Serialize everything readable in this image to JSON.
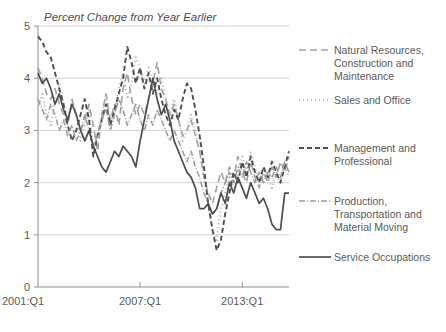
{
  "chart_data": {
    "type": "line",
    "title": "Percent Change from Year Earlier",
    "xlabel": "",
    "ylabel": "",
    "ylim": [
      0,
      5
    ],
    "yticks": [
      0,
      1,
      2,
      3,
      4,
      5
    ],
    "ytick_labels": [
      "0",
      "1",
      "2",
      "3",
      "4",
      "5"
    ],
    "grid": true,
    "grid_axis": "y",
    "legend_position": "right",
    "x_start_label": "2001:Q1",
    "xticks": [
      0,
      24,
      48
    ],
    "xtick_labels": [
      "2001:Q1",
      "2007:Q1",
      "2013:Q1"
    ],
    "x_count": 60,
    "series": [
      {
        "name": "Natural Resources, Construction and Maintenance",
        "legend_label_lines": [
          "Natural Resources,",
          "Construction and",
          "Maintenance"
        ],
        "style": "dashed",
        "color": "#a0a0a0",
        "width": 1.6,
        "dasharray": "7,4",
        "values": [
          4.2,
          4.0,
          3.7,
          3.6,
          3.8,
          3.5,
          3.3,
          3.1,
          3.6,
          3.3,
          3.0,
          3.2,
          3.5,
          3.1,
          2.6,
          3.3,
          3.7,
          3.2,
          3.5,
          3.1,
          3.8,
          4.1,
          3.6,
          3.3,
          3.5,
          3.3,
          3.6,
          3.9,
          4.3,
          3.8,
          3.6,
          3.3,
          3.5,
          3.2,
          2.9,
          3.0,
          3.2,
          2.9,
          2.6,
          2.1,
          1.8,
          1.6,
          1.9,
          2.2,
          2.0,
          2.3,
          2.1,
          2.5,
          2.2,
          2.0,
          2.4,
          2.1,
          1.9,
          2.2,
          2.0,
          2.3,
          2.1,
          2.4,
          2.2,
          2.5
        ]
      },
      {
        "name": "Sales and Office",
        "legend_label_lines": [
          "Sales and Office"
        ],
        "style": "dotted",
        "color": "#b5b5b5",
        "width": 2.2,
        "dasharray": "1,3",
        "values": [
          3.4,
          3.7,
          3.3,
          3.1,
          3.6,
          3.9,
          3.5,
          3.2,
          3.6,
          3.3,
          2.8,
          3.1,
          3.4,
          2.6,
          3.0,
          3.3,
          3.7,
          3.1,
          3.4,
          3.8,
          4.1,
          3.6,
          3.9,
          4.4,
          4.2,
          3.9,
          4.2,
          4.0,
          3.7,
          4.0,
          3.6,
          3.3,
          3.6,
          3.2,
          2.8,
          3.0,
          3.3,
          3.0,
          2.6,
          2.1,
          1.6,
          1.1,
          0.9,
          1.5,
          1.8,
          2.1,
          1.9,
          2.2,
          2.5,
          2.2,
          2.6,
          2.3,
          2.0,
          2.3,
          2.1,
          1.9,
          2.2,
          2.0,
          2.3,
          2.1
        ]
      },
      {
        "name": "Management and Professional",
        "legend_label_lines": [
          "Management and",
          "Professional"
        ],
        "style": "dashed-heavy",
        "color": "#4d4d4d",
        "width": 1.9,
        "dasharray": "5,3",
        "values": [
          4.8,
          4.7,
          4.5,
          4.4,
          4.1,
          3.8,
          3.5,
          3.1,
          2.8,
          3.0,
          3.3,
          3.6,
          3.2,
          2.5,
          2.9,
          3.2,
          3.5,
          3.1,
          3.4,
          3.7,
          4.0,
          4.6,
          4.3,
          3.9,
          4.2,
          3.8,
          4.1,
          3.7,
          4.0,
          3.6,
          3.3,
          3.1,
          3.4,
          3.2,
          3.6,
          3.9,
          3.8,
          3.4,
          2.9,
          2.3,
          1.6,
          1.1,
          0.7,
          0.9,
          1.4,
          1.8,
          2.2,
          2.0,
          2.4,
          2.1,
          2.5,
          2.2,
          2.0,
          2.3,
          2.1,
          2.4,
          2.2,
          2.0,
          2.3,
          2.6
        ]
      },
      {
        "name": "Production, Transportation and Material Moving",
        "legend_label_lines": [
          "Production,",
          "Transportation and",
          "Material Moving"
        ],
        "style": "dashdot",
        "color": "#9a9a9a",
        "width": 1.5,
        "dasharray": "6,2,1,2",
        "values": [
          3.6,
          3.4,
          3.2,
          3.5,
          3.3,
          3.0,
          3.2,
          2.9,
          3.1,
          2.8,
          3.0,
          3.3,
          3.0,
          2.7,
          2.9,
          3.2,
          3.4,
          3.0,
          3.3,
          3.6,
          3.4,
          3.1,
          3.3,
          3.5,
          3.2,
          3.0,
          3.3,
          3.1,
          3.4,
          3.2,
          3.0,
          2.8,
          3.0,
          2.8,
          2.6,
          2.4,
          2.6,
          2.3,
          2.1,
          1.8,
          1.6,
          1.4,
          1.5,
          1.8,
          2.0,
          2.2,
          2.0,
          2.3,
          2.1,
          2.4,
          2.2,
          2.0,
          2.2,
          2.0,
          2.2,
          2.1,
          2.3,
          2.1,
          2.4,
          2.2
        ]
      },
      {
        "name": "Service Occupations",
        "legend_label_lines": [
          "Service Occupations"
        ],
        "style": "solid",
        "color": "#4d4d4d",
        "width": 1.7,
        "dasharray": "none",
        "values": [
          4.1,
          3.9,
          4.0,
          3.8,
          3.5,
          3.7,
          3.4,
          3.2,
          3.5,
          3.3,
          3.0,
          2.8,
          3.0,
          2.7,
          2.5,
          2.3,
          2.2,
          2.4,
          2.6,
          2.5,
          2.7,
          2.6,
          2.5,
          2.3,
          2.8,
          3.2,
          3.6,
          4.0,
          3.6,
          3.3,
          3.5,
          3.2,
          2.8,
          2.6,
          2.4,
          2.2,
          2.1,
          1.9,
          1.5,
          1.5,
          1.6,
          1.4,
          1.5,
          1.8,
          1.6,
          2.0,
          1.8,
          2.1,
          1.9,
          1.7,
          2.0,
          1.8,
          1.6,
          1.7,
          1.5,
          1.2,
          1.1,
          1.1,
          1.8,
          1.8
        ]
      }
    ]
  },
  "legend": {
    "items": [
      {
        "label_lines": [
          "Natural Resources,",
          "Construction and",
          "Maintenance"
        ],
        "swatch": "dashed-line-swatch"
      },
      {
        "label_lines": [
          "Sales and Office"
        ],
        "swatch": "dotted-line-swatch"
      },
      {
        "label_lines": [
          "Management and",
          "Professional"
        ],
        "swatch": "dashed-heavy-line-swatch"
      },
      {
        "label_lines": [
          "Production,",
          "Transportation and",
          "Material Moving"
        ],
        "swatch": "dashdot-line-swatch"
      },
      {
        "label_lines": [
          "Service Occupations"
        ],
        "swatch": "solid-line-swatch"
      }
    ]
  }
}
